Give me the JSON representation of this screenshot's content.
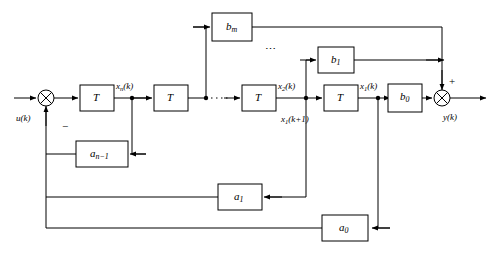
{
  "diagram": {
    "line_color": "#000000",
    "block_fill": "#ffffff",
    "background": "#ffffff",
    "signals": {
      "input": "u(k)",
      "output": "y(k)",
      "state_xn": "x",
      "state_xn_sub": "n",
      "state_xn_arg": "(k)",
      "state_x2": "x",
      "state_x2_sub": "2",
      "state_x2_arg": "(k)",
      "state_x1_next": "x",
      "state_x1_next_sub": "1",
      "state_x1_next_arg": "(k+1)",
      "state_x1": "x",
      "state_x1_sub": "1",
      "state_x1_arg": "(k)"
    },
    "signs": {
      "negative_feedback": "−",
      "positive_sum": "+"
    },
    "ellipsis_delay": "••••••",
    "ellipsis_top": "⋯",
    "delay_blocks": [
      {
        "name": "delay-1",
        "label": "T"
      },
      {
        "name": "delay-2",
        "label": "T"
      },
      {
        "name": "delay-3",
        "label": "T"
      },
      {
        "name": "delay-4",
        "label": "T"
      }
    ],
    "feedforward_blocks": [
      {
        "name": "gain-bm",
        "label": "b",
        "sub": "m"
      },
      {
        "name": "gain-b1",
        "label": "b",
        "sub": "1"
      },
      {
        "name": "gain-b0",
        "label": "b",
        "sub": "0"
      }
    ],
    "feedback_blocks": [
      {
        "name": "gain-an-1",
        "label": "a",
        "sub": "n−1"
      },
      {
        "name": "gain-a1",
        "label": "a",
        "sub": "1"
      },
      {
        "name": "gain-a0",
        "label": "a",
        "sub": "0"
      }
    ],
    "summing_junctions": [
      {
        "name": "input-summing-junction"
      },
      {
        "name": "output-summing-junction"
      }
    ]
  }
}
